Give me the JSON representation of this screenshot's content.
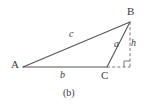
{
  "figure": {
    "caption": "(b)",
    "type": "geometry-diagram",
    "background_color": "#ffffff",
    "stroke_color": "#555555",
    "label_color": "#3a3a3a",
    "vertices": [
      {
        "id": "A",
        "label": "A",
        "x": 23,
        "y": 67
      },
      {
        "id": "B",
        "label": "B",
        "x": 130,
        "y": 22
      },
      {
        "id": "C",
        "label": "C",
        "x": 107,
        "y": 67
      },
      {
        "id": "F",
        "label": "",
        "x": 130,
        "y": 67
      }
    ],
    "solid_edges": [
      {
        "id": "AB",
        "label": "c",
        "from": "A",
        "to": "B"
      },
      {
        "id": "BC",
        "label": "a",
        "from": "B",
        "to": "C"
      },
      {
        "id": "AC",
        "label": "b",
        "from": "A",
        "to": "C"
      }
    ],
    "dashed_edges": [
      {
        "id": "BF",
        "label": "h",
        "from": "B",
        "to": "F"
      },
      {
        "id": "CF",
        "label": "",
        "from": "C",
        "to": "F"
      }
    ],
    "side_labels": {
      "c": "c",
      "b": "b",
      "a": "a",
      "h": "h"
    },
    "right_angle_marker": {
      "present": true,
      "at_vertex": "F",
      "size": 6
    }
  }
}
